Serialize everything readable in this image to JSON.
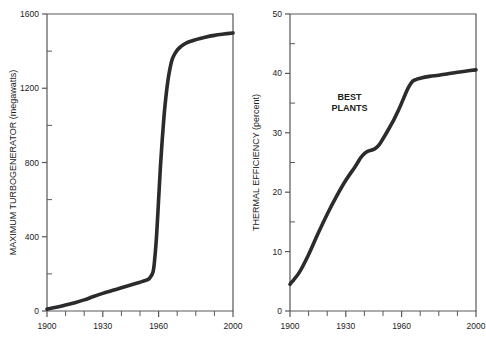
{
  "figure": {
    "background_color": "#ffffff",
    "curve_color": "#2b2b2e",
    "axis_color": "#58585c",
    "text_color": "#1c1c1c"
  },
  "chart_data": [
    {
      "panel": "left",
      "type": "line",
      "title": "",
      "xlabel": "",
      "ylabel": "MAXIMUM TURBOGENERATOR (megawatts)",
      "xlim": [
        1900,
        2000
      ],
      "ylim": [
        0,
        1600
      ],
      "xticks": [
        1900,
        1930,
        1960,
        2000
      ],
      "xtick_labels": [
        "1900",
        "1930",
        "1960",
        "2000"
      ],
      "xminor_ticks": [
        1910,
        1920,
        1940,
        1950,
        1970,
        1980,
        1990
      ],
      "yticks": [
        0,
        400,
        800,
        1200,
        1600
      ],
      "ytick_labels": [
        "0",
        "400",
        "800",
        "1200",
        "1600"
      ],
      "yminor_ticks": [
        200,
        600,
        1000,
        1400
      ],
      "grid": false,
      "legend": false,
      "series": [
        {
          "name": "Maximum turbogenerator rating",
          "x": [
            1900,
            1905,
            1910,
            1915,
            1920,
            1925,
            1930,
            1935,
            1940,
            1945,
            1950,
            1953,
            1955,
            1957,
            1958,
            1959,
            1960,
            1961,
            1962,
            1963,
            1964,
            1965,
            1966,
            1967,
            1968,
            1970,
            1972,
            1975,
            1980,
            1985,
            1990,
            1995,
            2000
          ],
          "values": [
            10,
            20,
            32,
            45,
            60,
            78,
            95,
            110,
            125,
            140,
            155,
            165,
            175,
            210,
            290,
            420,
            600,
            780,
            930,
            1060,
            1160,
            1240,
            1300,
            1345,
            1372,
            1405,
            1425,
            1445,
            1462,
            1475,
            1485,
            1492,
            1498
          ]
        }
      ]
    },
    {
      "panel": "right",
      "type": "line",
      "title": "",
      "xlabel": "",
      "ylabel": "THERMAL EFFICIENCY (percent)",
      "xlim": [
        1900,
        2000
      ],
      "ylim": [
        0,
        50
      ],
      "xticks": [
        1900,
        1930,
        1960,
        2000
      ],
      "xtick_labels": [
        "1900",
        "1930",
        "1960",
        "2000"
      ],
      "xminor_ticks": [
        1910,
        1920,
        1940,
        1950,
        1970,
        1980,
        1990
      ],
      "yticks": [
        0,
        10,
        20,
        30,
        40,
        50
      ],
      "ytick_labels": [
        "0",
        "10",
        "20",
        "30",
        "40",
        "50"
      ],
      "yminor_ticks": [
        5,
        15,
        25,
        35,
        45
      ],
      "grid": false,
      "legend": false,
      "annotations": [
        {
          "text_line_1": "BEST",
          "text_line_2": "PLANTS",
          "x": 1932,
          "y": 35.5
        }
      ],
      "series": [
        {
          "name": "Thermal efficiency of best plants",
          "x": [
            1900,
            1905,
            1910,
            1915,
            1920,
            1925,
            1930,
            1935,
            1938,
            1940,
            1942,
            1944,
            1946,
            1948,
            1950,
            1953,
            1956,
            1958,
            1960,
            1962,
            1964,
            1966,
            1968,
            1970,
            1975,
            1980,
            1985,
            1990,
            1995,
            2000
          ],
          "values": [
            4.5,
            6.5,
            9.5,
            13.0,
            16.3,
            19.3,
            22.0,
            24.3,
            25.8,
            26.5,
            26.9,
            27.1,
            27.4,
            28.0,
            29.0,
            30.6,
            32.3,
            33.6,
            35.0,
            36.5,
            37.8,
            38.7,
            39.0,
            39.2,
            39.5,
            39.7,
            39.95,
            40.2,
            40.4,
            40.6
          ]
        }
      ]
    }
  ]
}
